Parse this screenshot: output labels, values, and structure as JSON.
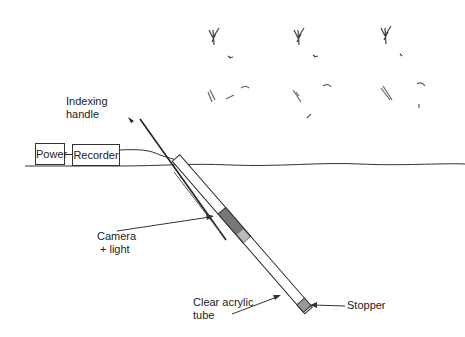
{
  "labels": {
    "indexing_handle_line1": "Indexing",
    "indexing_handle_line2": "handle",
    "power": "Power",
    "recorder": "Recorder",
    "camera_line1": "Camera",
    "camera_line2": "+ light",
    "tube_line1": "Clear acrylic",
    "tube_line2": "tube",
    "stopper": "Stopper"
  },
  "plants": [
    {
      "name": "plant-1",
      "x": 215
    },
    {
      "name": "plant-2",
      "x": 299
    },
    {
      "name": "plant-3",
      "x": 386
    }
  ],
  "colors": {
    "ink": "#222222",
    "camera_fill": "#777777",
    "stopper_fill": "#999999",
    "background": "#ffffff"
  }
}
